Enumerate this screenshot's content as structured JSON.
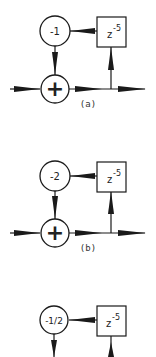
{
  "diagrams": [
    {
      "id": "a",
      "caption": "(a)",
      "gain": "-1",
      "delay_base": "z",
      "delay_exp": "-5",
      "adder_symbol": "+"
    },
    {
      "id": "b",
      "caption": "(b)",
      "gain": "-2",
      "delay_base": "z",
      "delay_exp": "-5",
      "adder_symbol": "+"
    },
    {
      "id": "c",
      "caption": "",
      "gain": "-1/2",
      "delay_base": "z",
      "delay_exp": "-5",
      "adder_symbol": "+"
    }
  ],
  "colors": {
    "stroke": "#1a1a1a",
    "background": "#ffffff"
  }
}
